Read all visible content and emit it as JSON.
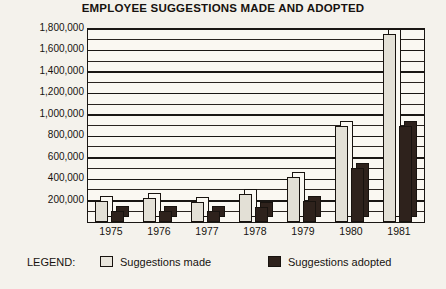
{
  "chart_data": {
    "type": "bar",
    "title": "EMPLOYEE SUGGESTIONS MADE AND ADOPTED",
    "xlabel": "",
    "ylabel": "",
    "categories": [
      "1975",
      "1976",
      "1977",
      "1978",
      "1979",
      "1980",
      "1981"
    ],
    "series": [
      {
        "name": "Suggestions made",
        "color": "#e3e0d6",
        "values": [
          200000,
          220000,
          190000,
          260000,
          420000,
          900000,
          1750000
        ]
      },
      {
        "name": "Suggestions adopted",
        "color": "#2e221c",
        "values": [
          105000,
          100000,
          100000,
          140000,
          200000,
          500000,
          900000
        ]
      }
    ],
    "ylim": [
      0,
      1800000
    ],
    "y_major_step": 200000,
    "y_minor_step": 100000,
    "y_tick_labels": [
      "1,800,000",
      "1,600,000",
      "1,400,000",
      "1,200,000",
      "1,000,000",
      "800,000",
      "600,000",
      "400,000",
      "200,000"
    ],
    "y_tick_values": [
      1800000,
      1600000,
      1400000,
      1200000,
      1000000,
      800000,
      600000,
      400000,
      200000
    ],
    "grid": true,
    "legend_position": "bottom"
  },
  "legend": {
    "title": "LEGEND:",
    "entries": [
      {
        "label": "Suggestions made",
        "swatch": "made"
      },
      {
        "label": "Suggestions adopted",
        "swatch": "adopted"
      }
    ]
  }
}
